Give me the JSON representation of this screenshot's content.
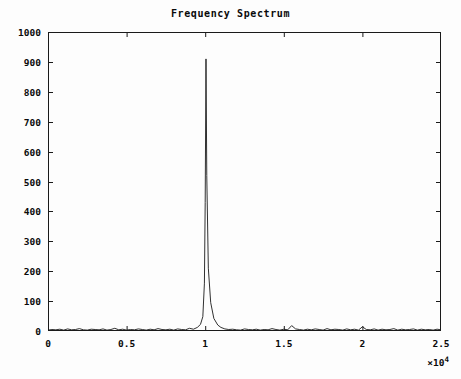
{
  "chart": {
    "title": "Frequency Spectrum",
    "x_exponent_prefix": "×10",
    "x_exponent_power": "4"
  },
  "chart_data": {
    "type": "line",
    "title": "Frequency Spectrum",
    "xlabel": "",
    "ylabel": "",
    "xlim": [
      0,
      25000
    ],
    "ylim": [
      0,
      1000
    ],
    "x_tick_values": [
      0,
      5000,
      10000,
      15000,
      20000,
      25000
    ],
    "x_tick_labels": [
      "0",
      "0.5",
      "1",
      "1.5",
      "2",
      "2.5"
    ],
    "x_axis_multiplier": 10000,
    "x_axis_multiplier_label": "×10⁴",
    "y_tick_values": [
      0,
      100,
      200,
      300,
      400,
      500,
      600,
      700,
      800,
      900,
      1000
    ],
    "y_tick_labels": [
      "0",
      "100",
      "200",
      "300",
      "400",
      "500",
      "600",
      "700",
      "800",
      "900",
      "1000"
    ],
    "grid": false,
    "legend": false,
    "line_color": "#1a1a1a",
    "background_color": "#fdfdfd",
    "series": [
      {
        "name": "Magnitude",
        "description": "Single sharp spectral peak near 10000 Hz on a low noise floor",
        "peak_x": 10050,
        "peak_y": 910,
        "peak_half_width": 60,
        "noise_floor_mean": 6,
        "noise_floor_max": 22,
        "x": [
          0,
          250,
          500,
          750,
          1000,
          1250,
          1500,
          1750,
          2000,
          2250,
          2500,
          2750,
          3000,
          3250,
          3500,
          3750,
          4000,
          4250,
          4500,
          4750,
          5000,
          5250,
          5500,
          5750,
          6000,
          6250,
          6500,
          6750,
          7000,
          7250,
          7500,
          7750,
          8000,
          8250,
          8500,
          8750,
          9000,
          9250,
          9500,
          9700,
          9850,
          9950,
          10000,
          10050,
          10100,
          10200,
          10350,
          10550,
          10800,
          11000,
          11250,
          11500,
          11750,
          12000,
          12250,
          12500,
          12750,
          13000,
          13250,
          13500,
          13750,
          14000,
          14250,
          14500,
          14750,
          15000,
          15250,
          15500,
          15750,
          16000,
          16250,
          16500,
          16750,
          17000,
          17250,
          17500,
          17750,
          18000,
          18250,
          18500,
          18750,
          19000,
          19250,
          19500,
          19750,
          20000,
          20250,
          20500,
          20750,
          21000,
          21250,
          21500,
          21750,
          22000,
          22250,
          22500,
          22750,
          23000,
          23250,
          23500,
          23750,
          24000,
          24250,
          24500,
          24750,
          25000
        ],
        "y": [
          3,
          5,
          4,
          6,
          3,
          7,
          4,
          5,
          8,
          4,
          3,
          6,
          5,
          4,
          7,
          3,
          5,
          9,
          4,
          6,
          3,
          5,
          4,
          7,
          5,
          3,
          6,
          4,
          8,
          5,
          4,
          6,
          3,
          7,
          5,
          4,
          9,
          6,
          12,
          22,
          48,
          160,
          430,
          910,
          520,
          210,
          95,
          42,
          20,
          12,
          7,
          5,
          6,
          4,
          3,
          7,
          5,
          4,
          6,
          3,
          5,
          4,
          8,
          5,
          3,
          6,
          4,
          18,
          7,
          5,
          3,
          6,
          4,
          7,
          5,
          3,
          8,
          4,
          6,
          5,
          3,
          7,
          4,
          6,
          3,
          14,
          5,
          4,
          7,
          3,
          6,
          4,
          5,
          8,
          3,
          6,
          4,
          5,
          7,
          3,
          6,
          4,
          5,
          3,
          6,
          4
        ]
      }
    ]
  },
  "y_ticks": [
    {
      "label": "1000",
      "value": 1000
    },
    {
      "label": "900",
      "value": 900
    },
    {
      "label": "800",
      "value": 800
    },
    {
      "label": "700",
      "value": 700
    },
    {
      "label": "600",
      "value": 600
    },
    {
      "label": "500",
      "value": 500
    },
    {
      "label": "400",
      "value": 400
    },
    {
      "label": "300",
      "value": 300
    },
    {
      "label": "200",
      "value": 200
    },
    {
      "label": "100",
      "value": 100
    },
    {
      "label": "0",
      "value": 0
    }
  ],
  "x_ticks": [
    {
      "label": "0",
      "value": 0
    },
    {
      "label": "0.5",
      "value": 5000
    },
    {
      "label": "1",
      "value": 10000
    },
    {
      "label": "1.5",
      "value": 15000
    },
    {
      "label": "2",
      "value": 20000
    },
    {
      "label": "2.5",
      "value": 25000
    }
  ]
}
